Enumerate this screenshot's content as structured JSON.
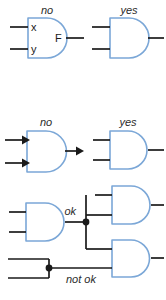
{
  "figure": {
    "colors": {
      "gate_outline": "#7ba7d7",
      "wire": "#1a1a1a",
      "annotation_text": "#2b2b2b",
      "background": "#ffffff"
    }
  },
  "labels": {
    "no_1": "no",
    "yes_1": "yes",
    "pin_x": "x",
    "pin_y": "y",
    "pin_f": "F",
    "no_2": "no",
    "yes_2": "yes",
    "ok": "ok",
    "not_ok": "not ok"
  },
  "sections": [
    {
      "id": "pin-labels",
      "examples": [
        {
          "verdict": "no",
          "gate": "and-gate",
          "inner_labels": [
            "x",
            "y",
            "F"
          ],
          "note": "signal names written inside the gate body"
        },
        {
          "verdict": "yes",
          "gate": "and-gate",
          "inner_labels": [],
          "note": "gate body left empty"
        }
      ]
    },
    {
      "id": "arrowheads",
      "examples": [
        {
          "verdict": "no",
          "gate": "and-gate",
          "wire_style": "arrowheads",
          "note": "arrowheads drawn on input and output wires"
        },
        {
          "verdict": "yes",
          "gate": "and-gate",
          "wire_style": "plain",
          "note": "plain wires with no arrowheads"
        }
      ]
    },
    {
      "id": "junctions",
      "examples": [
        {
          "verdict": "ok",
          "note": "one wire fanning out to two gates, junction dot on a T connection"
        },
        {
          "verdict": "not ok",
          "note": "two separate wires shorted together at a junction dot"
        }
      ]
    }
  ]
}
